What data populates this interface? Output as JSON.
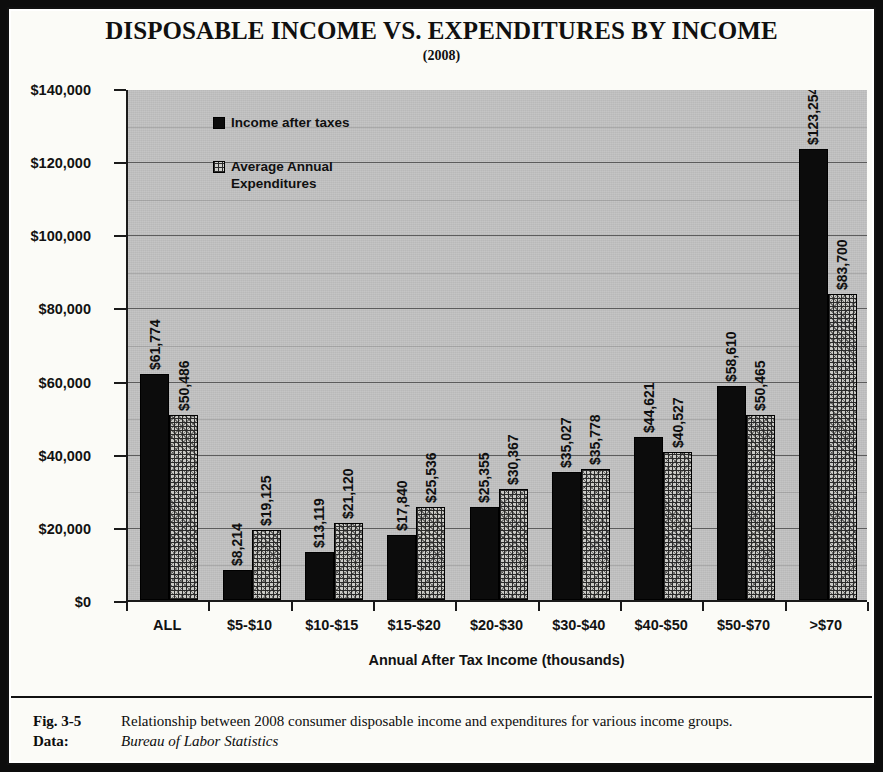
{
  "chart_data": {
    "type": "bar",
    "title": "DISPOSABLE INCOME VS. EXPENDITURES BY INCOME",
    "subtitle": "(2008)",
    "xlabel": "Annual After Tax Income (thousands)",
    "ylabel": "",
    "ylim": [
      0,
      140000
    ],
    "ytick_labels": [
      "$0",
      "$20,000",
      "$40,000",
      "$60,000",
      "$80,000",
      "$100,000",
      "$120,000",
      "$140,000"
    ],
    "ytick_values": [
      0,
      20000,
      40000,
      60000,
      80000,
      100000,
      120000,
      140000
    ],
    "grid": true,
    "legend_position": "inside-top-left",
    "categories": [
      "ALL",
      "$5-$10",
      "$10-$15",
      "$15-$20",
      "$20-$30",
      "$30-$40",
      "$40-$50",
      "$50-$70",
      ">$70"
    ],
    "series": [
      {
        "name": "Income after taxes",
        "fill": "solid-black",
        "color": "#0c0c0c",
        "values": [
          61774,
          8214,
          13119,
          17840,
          25355,
          35027,
          44621,
          58610,
          123254
        ],
        "labels": [
          "$61,774",
          "$8,214",
          "$13,119",
          "$17,840",
          "$25,355",
          "$35,027",
          "$44,621",
          "$58,610",
          "$123,254"
        ]
      },
      {
        "name": "Average Annual Expenditures",
        "fill": "crosshatch",
        "color": "#c9c9c5",
        "values": [
          50486,
          19125,
          21120,
          25536,
          30367,
          35778,
          40527,
          50465,
          83700
        ],
        "labels": [
          "$50,486",
          "$19,125",
          "$21,120",
          "$25,536",
          "$30,367",
          "$35,778",
          "$40,527",
          "$50,465",
          "$83,700"
        ]
      }
    ],
    "plot_background": "#b9b9b9"
  },
  "legend": {
    "series_1_label": "Income after taxes",
    "series_2_label_line1": "Average Annual",
    "series_2_label_line2": "Expenditures"
  },
  "caption": {
    "figure_key": "Fig. 3-5",
    "figure_text": "Relationship between 2008 consumer disposable income and expenditures for various income groups.",
    "data_key": "Data:",
    "data_text": "Bureau of Labor Statistics"
  }
}
